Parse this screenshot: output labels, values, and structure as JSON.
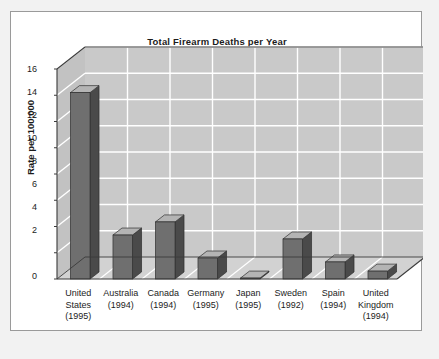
{
  "chart_data": {
    "type": "bar",
    "title": "Total Firearm Deaths per Year",
    "xlabel": "",
    "ylabel": "Rate per 100,000",
    "ylim": [
      0,
      16
    ],
    "yticks": [
      0,
      2,
      4,
      6,
      8,
      10,
      12,
      14,
      16
    ],
    "grid": true,
    "legend": "none",
    "style": "3d-column",
    "categories": [
      "United States (1995)",
      "Australia (1994)",
      "Canada (1994)",
      "Germany (1995)",
      "Japan (1995)",
      "Sweden (1992)",
      "Spain (1994)",
      "United Kingdom (1994)"
    ],
    "category_lines": [
      [
        "United",
        "States",
        "(1995)"
      ],
      [
        "Australia",
        "(1994)"
      ],
      [
        "Canada",
        "(1994)"
      ],
      [
        "Germany",
        "(1995)"
      ],
      [
        "Japan",
        "(1995)"
      ],
      [
        "Sweden",
        "(1992)"
      ],
      [
        "Spain",
        "(1994)"
      ],
      [
        "United",
        "Kingdom",
        "(1994)"
      ]
    ],
    "values": [
      14.2,
      3.35,
      4.35,
      1.6,
      0.07,
      3.05,
      1.3,
      0.6
    ],
    "ytick_labels": [
      "0",
      "2",
      "4",
      "6",
      "8",
      "10",
      "12",
      "14",
      "16"
    ],
    "colors": {
      "bar_front": "#6f6f6f",
      "bar_side": "#4a4a4a",
      "bar_top": "#b4b4b4",
      "back_wall": "#c9c9c9",
      "side_wall": "#c2c2c2",
      "floor": "#d2d2d2",
      "gridline": "#ffffff",
      "axis": "#3a3a3a",
      "card": "#ffffff",
      "frame": "#9a9a9a",
      "page": "#f2f2f2",
      "text": "#1c1c1c"
    }
  }
}
